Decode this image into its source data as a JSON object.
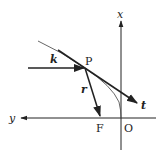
{
  "diagram": {
    "type": "geometry-vector-diagram",
    "colors": {
      "stroke": "#222222",
      "curve": "#555555",
      "background": "#ffffff"
    },
    "axes": {
      "x": {
        "label": "x",
        "direction": "up"
      },
      "y": {
        "label": "y",
        "direction": "left"
      }
    },
    "points": {
      "P": {
        "label": "P"
      },
      "F": {
        "label": "F"
      },
      "O": {
        "label": "O"
      }
    },
    "vectors": {
      "k": {
        "label": "k",
        "description": "incident direction into P"
      },
      "r": {
        "label": "r",
        "description": "from P to focus F"
      },
      "t": {
        "label": "t",
        "description": "tangent at P"
      }
    },
    "curve": {
      "description": "parabola-like arc through P ending at O"
    }
  }
}
